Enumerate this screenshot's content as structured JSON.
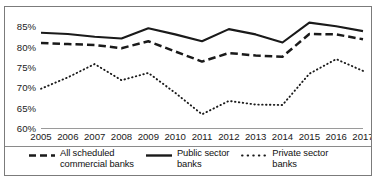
{
  "chart_data": {
    "type": "line",
    "title": "",
    "subtitle": "",
    "xlabel": "",
    "ylabel": "",
    "x": [
      2005,
      2006,
      2007,
      2008,
      2009,
      2010,
      2011,
      2012,
      2013,
      2014,
      2015,
      2016,
      2017
    ],
    "categories": [
      "2005",
      "2006",
      "2007",
      "2008",
      "2009",
      "2010",
      "2011",
      "2012",
      "2013",
      "2014",
      "2015",
      "2016",
      "2017"
    ],
    "ylim": [
      60,
      86.5
    ],
    "xlim": [
      2005,
      2017
    ],
    "ytick_values": [
      60,
      65,
      70,
      75,
      80,
      85
    ],
    "ytick_labels": [
      "60%",
      "65%",
      "70%",
      "75%",
      "80%",
      "85%"
    ],
    "grid": false,
    "legend_position": "bottom",
    "series": [
      {
        "name": "All scheduled\ncommercial banks",
        "label_line1": "All scheduled",
        "label_line2": "commercial banks",
        "style": "dashed",
        "color": "#1a1a1a",
        "values": [
          81.1,
          80.8,
          80.6,
          79.8,
          81.5,
          79.0,
          76.5,
          78.6,
          78.0,
          77.7,
          83.3,
          83.2,
          82.0
        ]
      },
      {
        "name": "Public sector\nbanks",
        "label_line1": "Public sector",
        "label_line2": "banks",
        "style": "solid",
        "color": "#1a1a1a",
        "values": [
          83.6,
          83.3,
          82.6,
          82.2,
          84.7,
          83.2,
          81.5,
          84.5,
          83.2,
          81.2,
          86.1,
          85.2,
          84.0
        ]
      },
      {
        "name": "Private sector\nbanks",
        "label_line1": "Private sector",
        "label_line2": "banks",
        "style": "dotted",
        "color": "#1a1a1a",
        "values": [
          69.8,
          72.6,
          75.9,
          71.9,
          73.7,
          68.8,
          63.5,
          66.8,
          65.9,
          65.8,
          73.5,
          77.1,
          74.2
        ]
      }
    ]
  },
  "legend": {
    "entries": [
      {
        "label_line1": "All scheduled",
        "label_line2": "commercial banks",
        "style": "dashed"
      },
      {
        "label_line1": "Public sector",
        "label_line2": "banks",
        "style": "solid"
      },
      {
        "label_line1": "Private sector",
        "label_line2": "banks",
        "style": "dotted"
      }
    ]
  }
}
